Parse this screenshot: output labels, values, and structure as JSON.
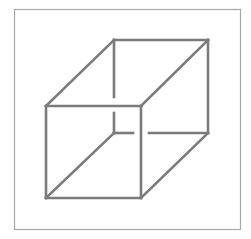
{
  "diagram": {
    "title": "",
    "kind": "wireframe-cube-necker",
    "colors": {
      "background": "#ffffff",
      "frame": "#a8a8a8",
      "edge": "#7b7b7b"
    },
    "frame": {
      "x": 14,
      "y": 9,
      "width": 226,
      "height": 220
    },
    "vertices": {
      "front_top_left": [
        46,
        106
      ],
      "front_top_right": [
        141,
        106
      ],
      "front_bottom_left": [
        46,
        198
      ],
      "front_bottom_right": [
        141,
        198
      ],
      "back_top_left": [
        114,
        40
      ],
      "back_top_right": [
        208,
        40
      ],
      "back_bottom_left": [
        114,
        133
      ],
      "back_bottom_right": [
        208,
        133
      ]
    },
    "edges": [
      {
        "name": "front-top-edge",
        "from": [
          46,
          106
        ],
        "to": [
          141,
          106
        ]
      },
      {
        "name": "front-bottom-edge",
        "from": [
          46,
          198
        ],
        "to": [
          141,
          198
        ]
      },
      {
        "name": "front-left-edge",
        "from": [
          46,
          106
        ],
        "to": [
          46,
          198
        ]
      },
      {
        "name": "front-right-edge",
        "from": [
          141,
          106
        ],
        "to": [
          141,
          198
        ]
      },
      {
        "name": "back-top-edge",
        "from": [
          114,
          40
        ],
        "to": [
          208,
          40
        ]
      },
      {
        "name": "back-right-edge",
        "from": [
          208,
          40
        ],
        "to": [
          208,
          133
        ]
      },
      {
        "name": "back-left-edge-upper",
        "from": [
          114,
          40
        ],
        "to": [
          114,
          97
        ]
      },
      {
        "name": "back-left-edge-lower",
        "from": [
          114,
          113
        ],
        "to": [
          114,
          133
        ]
      },
      {
        "name": "back-bottom-edge-left",
        "from": [
          114,
          133
        ],
        "to": [
          133,
          133
        ]
      },
      {
        "name": "back-bottom-edge-right",
        "from": [
          149,
          133
        ],
        "to": [
          208,
          133
        ]
      },
      {
        "name": "connector-top-left",
        "from": [
          46,
          106
        ],
        "to": [
          114,
          40
        ]
      },
      {
        "name": "connector-top-right",
        "from": [
          141,
          106
        ],
        "to": [
          208,
          40
        ]
      },
      {
        "name": "connector-bottom-left",
        "from": [
          46,
          198
        ],
        "to": [
          114,
          133
        ]
      },
      {
        "name": "connector-bottom-right",
        "from": [
          141,
          198
        ],
        "to": [
          208,
          133
        ]
      }
    ]
  }
}
